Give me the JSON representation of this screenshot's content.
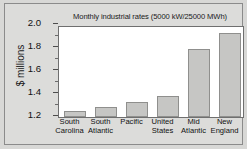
{
  "chart_data": {
    "type": "bar",
    "title": "Monthly industrial rates (5000 kW/25000 MWh)",
    "xlabel": "",
    "ylabel": "$ millions",
    "categories": [
      "South Carolina",
      "South Atlantic",
      "Pacific",
      "United States",
      "Mid Atlantic",
      "New England"
    ],
    "category_lines": [
      [
        "South",
        "Carolina"
      ],
      [
        "South",
        "Atlantic"
      ],
      [
        "Pacific",
        ""
      ],
      [
        "United",
        "States"
      ],
      [
        "Mid",
        "Atlantic"
      ],
      [
        "New",
        "England"
      ]
    ],
    "values": [
      1.25,
      1.29,
      1.33,
      1.38,
      1.79,
      1.93
    ],
    "ylim": [
      1.2,
      2.0
    ],
    "ytick_labels": [
      "1.2",
      "1.4",
      "1.6",
      "1.8",
      "2.0"
    ],
    "ytick_values": [
      1.2,
      1.4,
      1.6,
      1.8,
      2.0
    ],
    "yminor_values": [
      1.3,
      1.5,
      1.7,
      1.9
    ],
    "grid": false,
    "legend": "none",
    "bar_color": "#c6c6c4",
    "bar_edge_color": "#8f8f8d",
    "plot_background": "#ffffff",
    "figure_background": "#dcdcda"
  }
}
